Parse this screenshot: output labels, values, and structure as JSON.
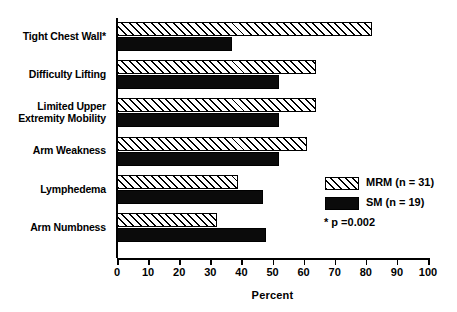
{
  "chart_data": {
    "type": "bar",
    "orientation": "horizontal",
    "title": "",
    "xlabel": "Percent",
    "ylabel": "",
    "xlim": [
      0,
      100
    ],
    "xticks": [
      0,
      10,
      20,
      30,
      40,
      50,
      60,
      70,
      80,
      90,
      100
    ],
    "grid": false,
    "legend_position": "right-middle",
    "categories": [
      "Tight Chest Wall*",
      "Difficulty Lifting",
      "Limited Upper Extremity Mobility",
      "Arm Weakness",
      "Lymphedema",
      "Arm Numbness"
    ],
    "category_lines": [
      [
        "Tight Chest Wall*"
      ],
      [
        "Difficulty Lifting"
      ],
      [
        "Limited Upper",
        "Extremity Mobility"
      ],
      [
        "Arm Weakness"
      ],
      [
        "Lymphedema"
      ],
      [
        "Arm Numbness"
      ]
    ],
    "series": [
      {
        "name": "MRM (n = 31)",
        "key": "mrm",
        "pattern": "diagonal-hatch",
        "color": "#ffffff",
        "values": [
          82,
          64,
          64,
          61,
          39,
          32
        ]
      },
      {
        "name": "SM (n = 19)",
        "key": "sm",
        "pattern": "solid",
        "color": "#000000",
        "values": [
          37,
          52,
          52,
          52,
          47,
          48
        ]
      }
    ],
    "annotations": [
      "* p =0.002"
    ]
  },
  "axis": {
    "x_title": "Percent",
    "tick_labels": [
      "0",
      "10",
      "20",
      "30",
      "40",
      "50",
      "60",
      "70",
      "80",
      "90",
      "100"
    ]
  },
  "legend": {
    "entries": [
      {
        "label": "MRM (n = 31)",
        "swatch": "hatched-swatch"
      },
      {
        "label": "SM (n = 19)",
        "swatch": "solid-black-swatch"
      }
    ],
    "note": "* p =0.002"
  },
  "colors": {
    "ink": "#000000",
    "background": "#ffffff",
    "series_sm": "#0b0b0b"
  }
}
